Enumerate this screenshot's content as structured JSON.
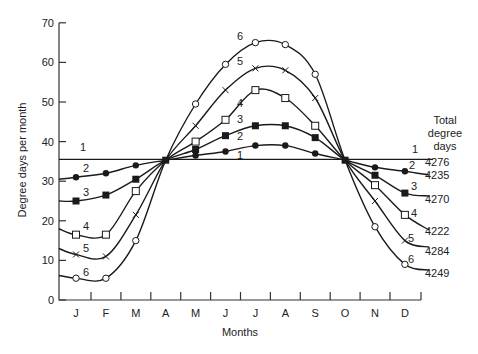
{
  "chart_data": {
    "type": "line",
    "title": "",
    "xlabel": "Months",
    "ylabel": "Degree days per month",
    "ylim": [
      0,
      70
    ],
    "yticks": [
      0,
      10,
      20,
      30,
      40,
      50,
      60,
      70
    ],
    "grid": false,
    "categories": [
      "J",
      "F",
      "M",
      "A",
      "M",
      "J",
      "J",
      "A",
      "S",
      "O",
      "N",
      "D"
    ],
    "legend_title": "Total degree days",
    "legend_position": "right",
    "series": [
      {
        "name": "1",
        "total": "4276",
        "marker": "none",
        "values": [
          35.5,
          35.5,
          35.5,
          35.5,
          35.5,
          35.5,
          35.5,
          35.5,
          35.5,
          35.5,
          35.5,
          35.5
        ]
      },
      {
        "name": "2",
        "total": "4235",
        "marker": "filled-circle",
        "values": [
          31,
          32,
          34,
          35.3,
          36.5,
          37.5,
          39,
          39,
          37,
          35.3,
          33.5,
          32.5
        ]
      },
      {
        "name": "3",
        "total": "4270",
        "marker": "filled-square",
        "values": [
          25,
          26.5,
          30.5,
          35.3,
          38,
          41.5,
          44,
          44,
          41,
          35.3,
          31.5,
          27
        ]
      },
      {
        "name": "4",
        "total": "4222",
        "marker": "open-square",
        "values": [
          16.5,
          16.5,
          27.5,
          35.3,
          40,
          45.5,
          53,
          51,
          44,
          35.3,
          29,
          21.5
        ]
      },
      {
        "name": "5",
        "total": "4284",
        "marker": "cross",
        "values": [
          11.5,
          11,
          21.5,
          35.3,
          44,
          53,
          58.5,
          58,
          51,
          35.3,
          25,
          15
        ]
      },
      {
        "name": "6",
        "total": "4249",
        "marker": "open-circle",
        "values": [
          5.5,
          5.5,
          15,
          35.3,
          49.5,
          59.5,
          65,
          64.5,
          57,
          35.3,
          18.5,
          9
        ]
      }
    ]
  }
}
